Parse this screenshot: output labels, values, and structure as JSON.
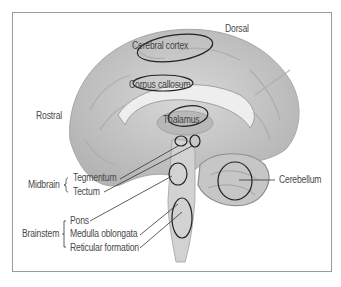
{
  "diagram": {
    "orientation": {
      "dorsal": "Dorsal",
      "rostral": "Rostral"
    },
    "structures": {
      "cerebral_cortex": "Cerebral cortex",
      "corpus_callosum": "Corpus callosum",
      "thalamus": "Thalamus",
      "cerebellum": "Cerebellum"
    },
    "groups": {
      "midbrain": {
        "label": "Midbrain",
        "items": [
          "Tegmentum",
          "Tectum"
        ]
      },
      "brainstem": {
        "label": "Brainstem",
        "items": [
          "Pons",
          "Medulla oblongata",
          "Reticular formation"
        ]
      }
    },
    "colors": {
      "brain": "#c9c9c9",
      "brain_dark": "#9e9e9e",
      "frame": "#9a9a9a",
      "outline": "#222222",
      "text": "#4a4a4a"
    }
  }
}
